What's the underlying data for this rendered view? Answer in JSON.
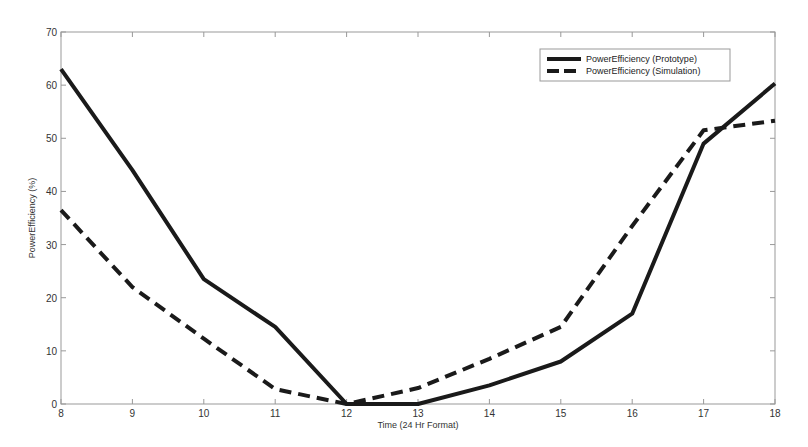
{
  "chart_data": {
    "type": "line",
    "title": "",
    "xlabel": "Time (24 Hr Format)",
    "ylabel": "PowerEfficiency (%)",
    "x": [
      8,
      9,
      10,
      11,
      12,
      13,
      14,
      15,
      16,
      17,
      18
    ],
    "xlim": [
      8,
      18
    ],
    "ylim": [
      0,
      70
    ],
    "xticks": [
      8,
      9,
      10,
      11,
      12,
      13,
      14,
      15,
      16,
      17,
      18
    ],
    "yticks": [
      0,
      10,
      20,
      30,
      40,
      50,
      60,
      70
    ],
    "grid": false,
    "legend_position": "upper right",
    "series": [
      {
        "name": "PowerEfficiency (Prototype)",
        "style": "solid",
        "color": "#1a1a1a",
        "values": [
          63,
          44,
          23.5,
          14.5,
          0,
          0,
          3.5,
          8,
          17,
          49,
          60.3
        ]
      },
      {
        "name": "PowerEfficiency (Simulation)",
        "style": "dashed",
        "color": "#1a1a1a",
        "values": [
          36.5,
          22,
          12.3,
          2.8,
          0,
          3,
          8.5,
          14.5,
          33.5,
          51.5,
          53.3
        ]
      }
    ]
  }
}
